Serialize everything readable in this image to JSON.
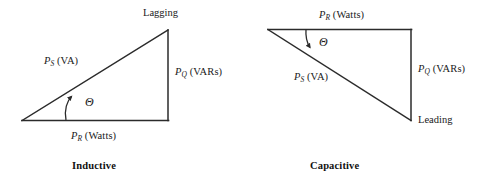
{
  "figure": {
    "type": "power-triangle-diagram",
    "background_color": "#ffffff",
    "stroke_color": "#2b2b2b",
    "text_color": "#1a1a1a",
    "width": 485,
    "height": 186
  },
  "diagrams": [
    {
      "id": "inductive",
      "caption": "Inductive",
      "vertex_label": "Lagging",
      "angle_symbol": "Θ",
      "sides": {
        "hypotenuse": {
          "symbol": "P",
          "subscript": "S",
          "unit": "(VA)"
        },
        "vertical": {
          "symbol": "P",
          "subscript": "Q",
          "unit": "(VARs)"
        },
        "horizontal": {
          "symbol": "P",
          "subscript": "R",
          "unit": "(Watts)"
        }
      },
      "geometry": {
        "origin": [
          22,
          120
        ],
        "right_angle_corner": [
          168,
          120
        ],
        "apex": [
          168,
          30
        ]
      }
    },
    {
      "id": "capacitive",
      "caption": "Capacitive",
      "vertex_label": "Leading",
      "angle_symbol": "Θ",
      "sides": {
        "hypotenuse": {
          "symbol": "P",
          "subscript": "S",
          "unit": "(VA)"
        },
        "vertical": {
          "symbol": "P",
          "subscript": "Q",
          "unit": "(VARs)"
        },
        "horizontal": {
          "symbol": "P",
          "subscript": "R",
          "unit": "(Watts)"
        }
      },
      "geometry": {
        "origin": [
          268,
          30
        ],
        "right_angle_corner": [
          411,
          30
        ],
        "apex": [
          411,
          120
        ]
      }
    }
  ],
  "labels": {
    "left_ps_sym": "P",
    "left_ps_sub": "S",
    "left_ps_unit": "(VA)",
    "left_pq_sym": "P",
    "left_pq_sub": "Q",
    "left_pq_unit": "(VARs)",
    "left_pr_sym": "P",
    "left_pr_sub": "R",
    "left_pr_unit": "(Watts)",
    "left_vertex": "Lagging",
    "left_theta": "Θ",
    "left_caption": "Inductive",
    "right_ps_sym": "P",
    "right_ps_sub": "S",
    "right_ps_unit": "(VA)",
    "right_pq_sym": "P",
    "right_pq_sub": "Q",
    "right_pq_unit": "(VARs)",
    "right_pr_sym": "P",
    "right_pr_sub": "R",
    "right_pr_unit": "(Watts)",
    "right_vertex": "Leading",
    "right_theta": "Θ",
    "right_caption": "Capacitive"
  }
}
